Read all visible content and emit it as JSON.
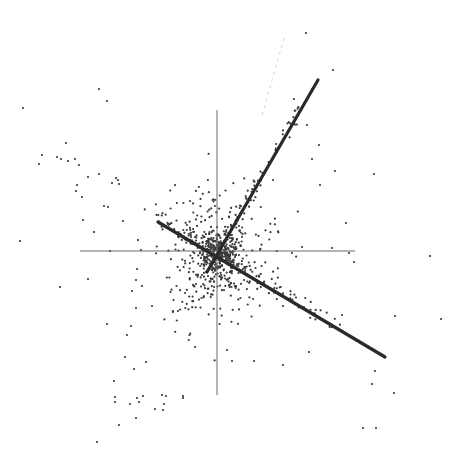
{
  "chart_data": {
    "type": "scatter",
    "title": "",
    "xlabel": "",
    "ylabel": "",
    "grid": false,
    "legend": null,
    "origin_px": [
      217,
      251
    ],
    "axes": {
      "horizontal": {
        "x1": 80,
        "y1": 251,
        "x2": 355,
        "y2": 251
      },
      "vertical": {
        "x1": 217,
        "y1": 110,
        "x2": 217,
        "y2": 395
      }
    },
    "direction_lines": [
      {
        "name": "component-1",
        "x1": 207,
        "y1": 272,
        "x2": 318,
        "y2": 80
      },
      {
        "name": "component-2",
        "x1": 158,
        "y1": 222,
        "x2": 385,
        "y2": 357
      }
    ],
    "faint_line": {
      "x1": 262,
      "y1": 115,
      "x2": 285,
      "y2": 35
    },
    "colors": {
      "points": "#3a3a3a",
      "lines": "#2a2a2a",
      "axes": "#6a6a6a",
      "background": "#ffffff"
    },
    "outlier_points": [
      [
        23,
        108
      ],
      [
        99,
        89
      ],
      [
        107,
        101
      ],
      [
        306,
        33
      ],
      [
        333,
        70
      ],
      [
        20,
        241
      ],
      [
        60,
        287
      ],
      [
        430,
        256
      ],
      [
        395,
        316
      ],
      [
        441,
        319
      ],
      [
        375,
        371
      ],
      [
        363,
        428
      ],
      [
        376,
        428
      ],
      [
        97,
        442
      ],
      [
        119,
        425
      ],
      [
        115,
        402
      ],
      [
        137,
        398
      ],
      [
        166,
        396
      ],
      [
        183,
        396
      ],
      [
        163,
        410
      ],
      [
        394,
        393
      ],
      [
        307,
        125
      ],
      [
        273,
        180
      ],
      [
        312,
        159
      ],
      [
        319,
        145
      ],
      [
        320,
        185
      ],
      [
        335,
        171
      ],
      [
        374,
        174
      ],
      [
        346,
        223
      ],
      [
        42,
        155
      ],
      [
        39,
        164
      ],
      [
        66,
        143
      ],
      [
        57,
        157
      ],
      [
        61,
        159
      ],
      [
        68,
        161
      ],
      [
        75,
        159
      ],
      [
        79,
        165
      ],
      [
        88,
        177
      ],
      [
        77,
        185
      ],
      [
        76,
        191
      ],
      [
        82,
        197
      ],
      [
        99,
        174
      ],
      [
        112,
        183
      ],
      [
        116,
        178
      ],
      [
        118,
        180
      ],
      [
        119,
        184
      ],
      [
        83,
        220
      ],
      [
        94,
        232
      ],
      [
        104,
        206
      ],
      [
        108,
        207
      ],
      [
        123,
        221
      ],
      [
        110,
        251
      ],
      [
        141,
        250
      ],
      [
        88,
        279
      ],
      [
        152,
        306
      ],
      [
        136,
        308
      ],
      [
        134,
        369
      ],
      [
        146,
        362
      ],
      [
        162,
        395
      ],
      [
        136,
        418
      ],
      [
        114,
        381
      ],
      [
        125,
        357
      ],
      [
        127,
        335
      ],
      [
        131,
        326
      ],
      [
        132,
        291
      ],
      [
        136,
        280
      ],
      [
        137,
        269
      ],
      [
        142,
        286
      ],
      [
        107,
        324
      ],
      [
        139,
        402
      ],
      [
        143,
        396
      ],
      [
        130,
        404
      ],
      [
        164,
        404
      ],
      [
        183,
        398
      ],
      [
        155,
        409
      ],
      [
        115,
        397
      ],
      [
        259,
        276
      ],
      [
        302,
        247
      ],
      [
        292,
        253
      ],
      [
        332,
        248
      ],
      [
        349,
        253
      ],
      [
        354,
        262
      ],
      [
        342,
        315
      ],
      [
        279,
        294
      ],
      [
        309,
        352
      ],
      [
        372,
        384
      ],
      [
        253,
        299
      ],
      [
        283,
        306
      ],
      [
        227,
        350
      ],
      [
        232,
        361
      ],
      [
        254,
        361
      ],
      [
        283,
        365
      ]
    ],
    "cluster": {
      "count": 560,
      "center": [
        217,
        251
      ],
      "spread_x": 26,
      "spread_y": 28,
      "seed": 1337,
      "arm_points": [
        {
          "from": [
            217,
            251
          ],
          "to": [
            300,
            110
          ],
          "count": 70,
          "jitter": 4
        },
        {
          "from": [
            217,
            251
          ],
          "to": [
            360,
            340
          ],
          "count": 70,
          "jitter": 4
        },
        {
          "from": [
            217,
            251
          ],
          "to": [
            150,
            210
          ],
          "count": 45,
          "jitter": 4
        },
        {
          "from": [
            217,
            251
          ],
          "to": [
            175,
            330
          ],
          "count": 40,
          "jitter": 8
        }
      ]
    }
  }
}
